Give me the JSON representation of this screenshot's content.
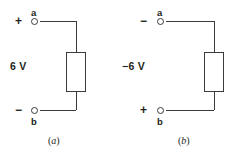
{
  "figure": {
    "background_color": "#ffffff",
    "line_color": "#3b3b3d",
    "text_color": "#231f20"
  },
  "circuits": [
    {
      "id": "a",
      "caption_open": "(",
      "caption_letter": "a",
      "caption_close": ")",
      "voltage_label": "6 V",
      "top_node_label": "a",
      "top_sign": "+",
      "bottom_node_label": "b",
      "bottom_sign": "−"
    },
    {
      "id": "b",
      "caption_open": "(",
      "caption_letter": "b",
      "caption_close": ")",
      "voltage_label": "−6 V",
      "top_node_label": "a",
      "top_sign": "−",
      "bottom_node_label": "b",
      "bottom_sign": "+"
    }
  ]
}
